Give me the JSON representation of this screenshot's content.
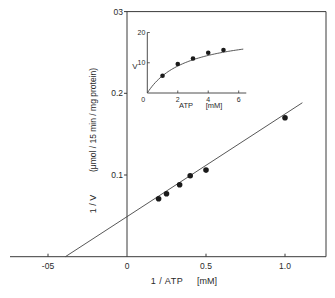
{
  "chart_data": [
    {
      "type": "scatter",
      "role": "main",
      "title": "",
      "xlabel": "1 / ATP",
      "xlabel_unit": "[mM]",
      "ylabel": "1 / V",
      "ylabel_unit": "(μmol / 15 min / mg protein)",
      "xlim": [
        -0.72,
        1.26
      ],
      "ylim": [
        0,
        0.3
      ],
      "xticks": [
        -0.5,
        0,
        0.5,
        1.0
      ],
      "xtick_labels": [
        "-05",
        "0",
        "0.5",
        "1.0"
      ],
      "yticks": [
        0.1,
        0.2,
        0.3
      ],
      "ytick_labels": [
        "0.1",
        "0.2",
        "03"
      ],
      "grid": false,
      "points": {
        "x": [
          0.2,
          0.25,
          0.333,
          0.4,
          0.5,
          1.0
        ],
        "y": [
          0.071,
          0.077,
          0.088,
          0.099,
          0.106,
          0.17
        ]
      },
      "fit_line": {
        "x_intercept": -0.39,
        "y_intercept": 0.049,
        "x_range": [
          -0.39,
          1.11
        ]
      }
    },
    {
      "type": "scatter",
      "role": "inset",
      "title": "",
      "xlabel": "ATP",
      "xlabel_unit": "[mM]",
      "ylabel": "V",
      "xlim": [
        0,
        6.3
      ],
      "ylim": [
        0,
        20
      ],
      "xticks": [
        0,
        2,
        4,
        6
      ],
      "xtick_labels": [
        "0",
        "2",
        "4",
        "6"
      ],
      "yticks": [
        10,
        20
      ],
      "ytick_labels": [
        "10",
        "20"
      ],
      "points": {
        "x": [
          1,
          2,
          3,
          4,
          5
        ],
        "y": [
          5.7,
          9.6,
          11.4,
          13.3,
          14.2
        ]
      },
      "curve": {
        "model": "michaelis-menten",
        "vmax": 20.5,
        "km": 2.6,
        "x_range": [
          0,
          6.3
        ]
      }
    }
  ]
}
